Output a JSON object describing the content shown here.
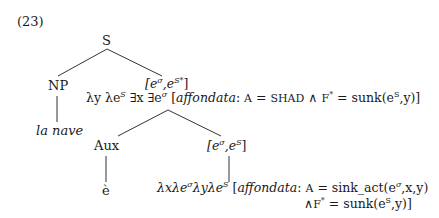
{
  "example_number": "(23)",
  "tree": {
    "root": {
      "label": "S"
    },
    "np": {
      "label": "NP",
      "leaf": "la nave"
    },
    "vp": {
      "type_open": "[e",
      "type_sup1": "σ",
      "type_mid": ",e",
      "type_sup2": "S*",
      "type_close": "]",
      "formula": {
        "part1": "λy λe",
        "sup1": "S",
        "part2": " ∃x ∃e",
        "sup2": "σ",
        "part3": " [",
        "affondata": "affondata",
        "colon": ":",
        "a_label": "A",
        "eq1": " = ",
        "shad": "SHAD",
        "and": " ∧ ",
        "f_label": "F",
        "fstar": "*",
        "eq2": " = sunk(e",
        "sup3": "S",
        "tail": ",y)]"
      }
    },
    "aux": {
      "label": "Aux",
      "leaf": "è"
    },
    "v": {
      "type_open": "[e",
      "type_sup1": "σ",
      "type_mid": ",e",
      "type_sup2": "S",
      "type_close": "]",
      "formula_line1": {
        "part1": "λxλe",
        "sup1": "σ",
        "part2": "λyλe",
        "sup2": "S",
        "part3": " [",
        "affondata": "affondata",
        "colon": ":",
        "a_label": "A",
        "eq": " = sink_act(e",
        "sup3": "σ",
        "tail": ",x,y)"
      },
      "formula_line2": {
        "and": "∧",
        "f_label": "F",
        "fstar": "*",
        "eq": " = sunk(e",
        "sup": "S",
        "tail": ",y)]"
      }
    }
  }
}
